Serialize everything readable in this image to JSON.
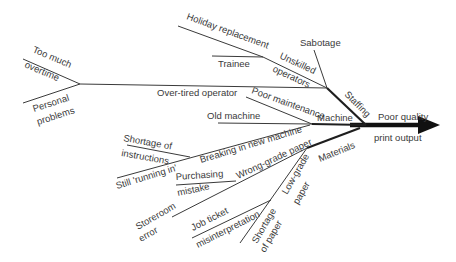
{
  "diagram": {
    "type": "fishbone",
    "effect": {
      "line1": "Poor quality",
      "line2": "print output"
    },
    "categories": {
      "staffing": "Staffing",
      "machine": "Machine",
      "materials": "Materials"
    },
    "causes": {
      "over_tired_operator": "Over-tired operator",
      "too_much_overtime_1": "Too much",
      "too_much_overtime_2": "overtime",
      "personal_problems_1": "Personal",
      "personal_problems_2": "problems",
      "sabotage": "Sabotage",
      "unskilled_operators_1": "Unskilled",
      "unskilled_operators_2": "operators",
      "holiday_replacement": "Holiday replacement",
      "trainee": "Trainee",
      "poor_maintenance": "Poor maintenance",
      "old_machine": "Old machine",
      "breaking_in_new_machine": "Breaking in new machine",
      "shortage_of_instructions_1": "Shortage of",
      "shortage_of_instructions_2": "instructions",
      "still_running_in": "Still 'running in'",
      "wrong_grade_paper": "Wrong-grade paper",
      "purchasing_mistake_1": "Purchasing",
      "purchasing_mistake_2": "mistake",
      "storeroom_error_1": "Storeroom",
      "storeroom_error_2": "error",
      "low_grade_paper_1": "Low-grade",
      "low_grade_paper_2": "paper",
      "job_ticket_1": "Job ticket",
      "job_ticket_2": "misinterpretation",
      "shortage_of_paper_1": "Shortage",
      "shortage_of_paper_2": "of paper"
    },
    "colors": {
      "line": "#1e1e1e",
      "text": "#3a3a3a",
      "background": "#ffffff"
    }
  }
}
